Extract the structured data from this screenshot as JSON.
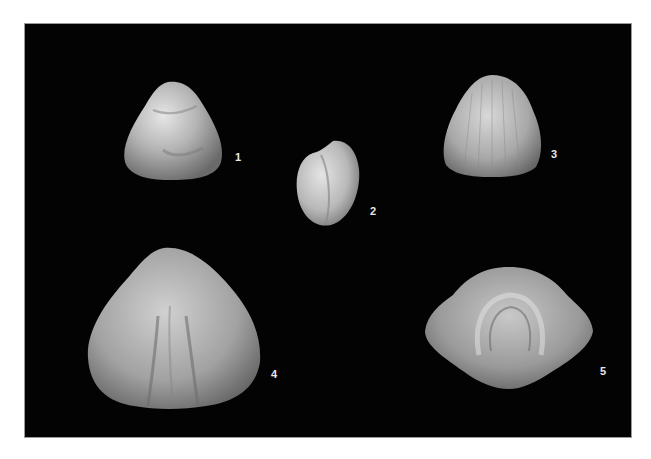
{
  "plate": {
    "background": "#030303",
    "specimens": [
      {
        "label": "1",
        "description": "fossil brachiopod shell, rounded triangular"
      },
      {
        "label": "2",
        "description": "small oval fossil shell, lateral view"
      },
      {
        "label": "3",
        "description": "fossil brachiopod shell with radial striations"
      },
      {
        "label": "4",
        "description": "large fossil brachiopod shell, dorsal view"
      },
      {
        "label": "5",
        "description": "fossil brachiopod shell, anterior view"
      }
    ]
  }
}
